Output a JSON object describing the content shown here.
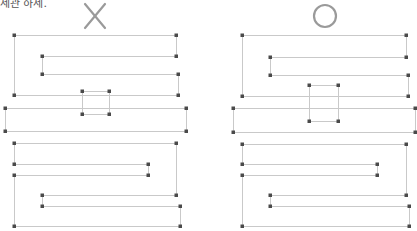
{
  "caption": "세관 하세.",
  "colors": {
    "line": "#c9c9c9",
    "point": "#4a4a4a",
    "mark": "#9a9a9a",
    "fill": "#f6f6f6"
  },
  "panels": [
    {
      "id": "left",
      "verdict": "X",
      "verdict_icon": "cross-mark-icon",
      "mark_center": [
        95,
        16
      ],
      "segments": [
        [
          [
            14,
            35
          ],
          [
            176,
            35
          ]
        ],
        [
          [
            176,
            35
          ],
          [
            176,
            56
          ]
        ],
        [
          [
            176,
            56
          ],
          [
            42,
            56
          ]
        ],
        [
          [
            42,
            56
          ],
          [
            42,
            74
          ]
        ],
        [
          [
            42,
            74
          ],
          [
            178,
            74
          ]
        ],
        [
          [
            178,
            74
          ],
          [
            178,
            95
          ]
        ],
        [
          [
            178,
            95
          ],
          [
            14,
            95
          ]
        ],
        [
          [
            14,
            95
          ],
          [
            14,
            35
          ]
        ],
        [
          [
            82,
            91
          ],
          [
            109,
            91
          ]
        ],
        [
          [
            109,
            91
          ],
          [
            109,
            114
          ]
        ],
        [
          [
            109,
            114
          ],
          [
            82,
            114
          ]
        ],
        [
          [
            82,
            114
          ],
          [
            82,
            91
          ]
        ],
        [
          [
            5,
            108
          ],
          [
            186,
            108
          ]
        ],
        [
          [
            186,
            108
          ],
          [
            186,
            131
          ]
        ],
        [
          [
            186,
            131
          ],
          [
            5,
            131
          ]
        ],
        [
          [
            5,
            131
          ],
          [
            5,
            108
          ]
        ],
        [
          [
            14,
            143
          ],
          [
            176,
            143
          ]
        ],
        [
          [
            176,
            143
          ],
          [
            176,
            195
          ]
        ],
        [
          [
            176,
            195
          ],
          [
            42,
            195
          ]
        ],
        [
          [
            42,
            195
          ],
          [
            42,
            206
          ]
        ],
        [
          [
            42,
            206
          ],
          [
            180,
            206
          ]
        ],
        [
          [
            180,
            206
          ],
          [
            180,
            226
          ]
        ],
        [
          [
            180,
            226
          ],
          [
            14,
            226
          ]
        ],
        [
          [
            14,
            226
          ],
          [
            14,
            175
          ]
        ],
        [
          [
            14,
            175
          ],
          [
            148,
            175
          ]
        ],
        [
          [
            148,
            175
          ],
          [
            148,
            164
          ]
        ],
        [
          [
            148,
            164
          ],
          [
            14,
            164
          ]
        ],
        [
          [
            14,
            164
          ],
          [
            14,
            143
          ]
        ]
      ],
      "points": [
        [
          14,
          35
        ],
        [
          176,
          35
        ],
        [
          42,
          56
        ],
        [
          176,
          56
        ],
        [
          42,
          74
        ],
        [
          178,
          74
        ],
        [
          14,
          95
        ],
        [
          178,
          95
        ],
        [
          82,
          91
        ],
        [
          109,
          91
        ],
        [
          82,
          114
        ],
        [
          109,
          114
        ],
        [
          5,
          108
        ],
        [
          186,
          108
        ],
        [
          5,
          131
        ],
        [
          186,
          131
        ],
        [
          14,
          143
        ],
        [
          176,
          143
        ],
        [
          14,
          164
        ],
        [
          148,
          164
        ],
        [
          14,
          175
        ],
        [
          148,
          175
        ],
        [
          42,
          195
        ],
        [
          176,
          195
        ],
        [
          42,
          206
        ],
        [
          180,
          206
        ],
        [
          14,
          226
        ],
        [
          180,
          226
        ]
      ]
    },
    {
      "id": "right",
      "verdict": "O",
      "verdict_icon": "circle-mark-icon",
      "mark_center": [
        325,
        16
      ],
      "segments": [
        [
          [
            242,
            35
          ],
          [
            406,
            35
          ]
        ],
        [
          [
            406,
            35
          ],
          [
            406,
            57
          ]
        ],
        [
          [
            406,
            57
          ],
          [
            270,
            57
          ]
        ],
        [
          [
            270,
            57
          ],
          [
            270,
            75
          ]
        ],
        [
          [
            270,
            75
          ],
          [
            408,
            75
          ]
        ],
        [
          [
            408,
            75
          ],
          [
            408,
            96
          ]
        ],
        [
          [
            408,
            96
          ],
          [
            242,
            96
          ]
        ],
        [
          [
            242,
            96
          ],
          [
            242,
            35
          ]
        ],
        [
          [
            309,
            85
          ],
          [
            338,
            85
          ]
        ],
        [
          [
            309,
            85
          ],
          [
            309,
            121
          ]
        ],
        [
          [
            338,
            85
          ],
          [
            338,
            121
          ]
        ],
        [
          [
            309,
            121
          ],
          [
            338,
            121
          ]
        ],
        [
          [
            233,
            108
          ],
          [
            415,
            108
          ]
        ],
        [
          [
            415,
            108
          ],
          [
            415,
            132
          ]
        ],
        [
          [
            415,
            132
          ],
          [
            233,
            132
          ]
        ],
        [
          [
            233,
            132
          ],
          [
            233,
            108
          ]
        ],
        [
          [
            242,
            144
          ],
          [
            406,
            144
          ]
        ],
        [
          [
            406,
            144
          ],
          [
            406,
            195
          ]
        ],
        [
          [
            406,
            195
          ],
          [
            270,
            195
          ]
        ],
        [
          [
            270,
            195
          ],
          [
            270,
            206
          ]
        ],
        [
          [
            270,
            206
          ],
          [
            409,
            206
          ]
        ],
        [
          [
            409,
            206
          ],
          [
            409,
            226
          ]
        ],
        [
          [
            409,
            226
          ],
          [
            242,
            226
          ]
        ],
        [
          [
            242,
            226
          ],
          [
            242,
            175
          ]
        ],
        [
          [
            242,
            175
          ],
          [
            377,
            175
          ]
        ],
        [
          [
            377,
            175
          ],
          [
            377,
            164
          ]
        ],
        [
          [
            377,
            164
          ],
          [
            242,
            164
          ]
        ],
        [
          [
            242,
            164
          ],
          [
            242,
            144
          ]
        ]
      ],
      "points": [
        [
          242,
          35
        ],
        [
          406,
          35
        ],
        [
          270,
          57
        ],
        [
          406,
          57
        ],
        [
          270,
          75
        ],
        [
          408,
          75
        ],
        [
          242,
          96
        ],
        [
          408,
          96
        ],
        [
          309,
          85
        ],
        [
          338,
          85
        ],
        [
          309,
          121
        ],
        [
          338,
          121
        ],
        [
          233,
          108
        ],
        [
          415,
          108
        ],
        [
          233,
          132
        ],
        [
          415,
          132
        ],
        [
          242,
          144
        ],
        [
          406,
          144
        ],
        [
          242,
          164
        ],
        [
          377,
          164
        ],
        [
          242,
          175
        ],
        [
          377,
          175
        ],
        [
          270,
          195
        ],
        [
          406,
          195
        ],
        [
          270,
          206
        ],
        [
          409,
          206
        ],
        [
          242,
          226
        ],
        [
          409,
          226
        ]
      ]
    }
  ]
}
